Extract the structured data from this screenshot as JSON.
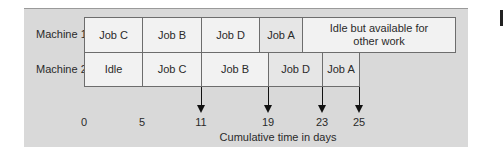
{
  "diagram": {
    "type": "gantt",
    "rows": [
      {
        "label": "Machine 1",
        "segments": [
          {
            "label": "Job C",
            "start": 0,
            "end": 5
          },
          {
            "label": "Job B",
            "start": 5,
            "end": 11
          },
          {
            "label": "Job D",
            "start": 11,
            "end": 16
          },
          {
            "label": "Job A",
            "start": 16,
            "end": 20
          },
          {
            "label": "Idle but available for other work",
            "label_line1": "Idle but available for",
            "label_line2": "other work",
            "start": 20,
            "end": null
          }
        ]
      },
      {
        "label": "Machine 2",
        "segments": [
          {
            "label": "Idle",
            "start": 0,
            "end": 5
          },
          {
            "label": "Job C",
            "start": 5,
            "end": 11
          },
          {
            "label": "Job B",
            "start": 11,
            "end": 19
          },
          {
            "label": "Job D",
            "start": 19,
            "end": 23
          },
          {
            "label": "Job A",
            "start": 23,
            "end": 25
          }
        ]
      }
    ],
    "axis": {
      "ticks": [
        "0",
        "5",
        "11",
        "19",
        "23",
        "25"
      ],
      "arrow_ticks": [
        "11",
        "19",
        "23",
        "25"
      ],
      "label": "Cumulative time in days"
    }
  },
  "colors": {
    "panel": "#d9d9d9",
    "cell": "#f2f2f2",
    "border": "#6d6d6d",
    "arrow": "#111111"
  }
}
